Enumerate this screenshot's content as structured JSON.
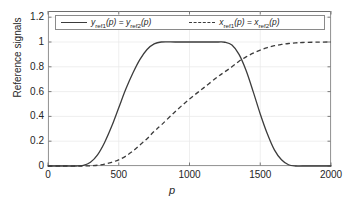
{
  "figure": {
    "background_color": "#ffffff",
    "axes_color": "#6e6e6e",
    "grid_color": "#e8e8e8",
    "curve_color": "#3c3c3c"
  },
  "axis": {
    "ylabel": "Reference signals",
    "xlabel": "p",
    "yticks": [
      "0",
      "0.2",
      "0.4",
      "0.6",
      "0.8",
      "1",
      "1.2"
    ],
    "xticks": [
      "0",
      "500",
      "1000",
      "1500",
      "2000"
    ]
  },
  "legend": {
    "entries": [
      {
        "style": "solid",
        "var1": "y",
        "sub1": "ref1",
        "eq": " = ",
        "var2": "y",
        "sub2": "ref2",
        "arg": "p",
        "text": "y_ref1(p) = y_ref2(p)"
      },
      {
        "style": "dashed",
        "var1": "x",
        "sub1": "ref1",
        "eq": " = ",
        "var2": "x",
        "sub2": "ref2",
        "arg": "p",
        "text": "x_ref1(p) = x_ref2(p)"
      }
    ]
  },
  "chart_data": {
    "type": "line",
    "title": "",
    "xlabel": "p",
    "ylabel": "Reference signals",
    "xlim": [
      0,
      2000
    ],
    "ylim": [
      0,
      1.25
    ],
    "grid": true,
    "legend_position": "top",
    "xticks": [
      0,
      500,
      1000,
      1500,
      2000
    ],
    "yticks": [
      0,
      0.2,
      0.4,
      0.6,
      0.8,
      1,
      1.2
    ],
    "x": [
      0,
      100,
      200,
      250,
      300,
      350,
      400,
      450,
      500,
      550,
      600,
      650,
      700,
      750,
      800,
      900,
      1000,
      1100,
      1200,
      1250,
      1300,
      1350,
      1400,
      1450,
      1500,
      1550,
      1600,
      1650,
      1700,
      1750,
      1800,
      1900,
      2000
    ],
    "series": [
      {
        "name": "y_ref1(p) = y_ref2(p)",
        "style": "solid",
        "values": [
          0,
          0,
          0,
          0.005,
          0.03,
          0.09,
          0.19,
          0.32,
          0.47,
          0.62,
          0.75,
          0.86,
          0.94,
          0.985,
          1.0,
          1.0,
          1.0,
          1.0,
          1.0,
          0.998,
          0.975,
          0.9,
          0.77,
          0.6,
          0.42,
          0.26,
          0.13,
          0.05,
          0.01,
          0.0,
          0.0,
          0.0,
          0.0
        ]
      },
      {
        "name": "x_ref1(p) = x_ref2(p)",
        "style": "dashed",
        "values": [
          0,
          0,
          0,
          0.0,
          0.002,
          0.006,
          0.015,
          0.03,
          0.05,
          0.08,
          0.12,
          0.17,
          0.22,
          0.28,
          0.33,
          0.44,
          0.54,
          0.63,
          0.72,
          0.76,
          0.8,
          0.845,
          0.88,
          0.91,
          0.935,
          0.955,
          0.97,
          0.98,
          0.988,
          0.993,
          0.996,
          0.999,
          1.0
        ]
      }
    ],
    "annotations": {
      "crossing_point": {
        "x": 1350,
        "y": 0.85
      }
    }
  }
}
